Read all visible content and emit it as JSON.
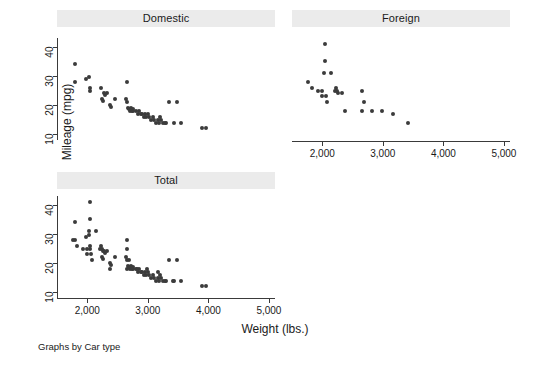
{
  "figure": {
    "y_axis_title": "Mileage (mpg)",
    "x_axis_title": "Weight (lbs.)",
    "note": "Graphs by Car type",
    "background": "#ffffff",
    "marker_color": "#3b3b3b",
    "strip_color": "#ebebeb",
    "axis_color": "#3a3a3a"
  },
  "chart_data": {
    "type": "scatter",
    "title": "",
    "xlabel": "Weight (lbs.)",
    "ylabel": "Mileage (mpg)",
    "note": "Graphs by Car type",
    "xlim": [
      1500,
      5100
    ],
    "ylim": [
      8,
      43
    ],
    "xticks": [
      2000,
      3000,
      4000,
      5000
    ],
    "xtick_labels": [
      "2,000",
      "3,000",
      "4,000",
      "5,000"
    ],
    "yticks": [
      10,
      20,
      30,
      40
    ],
    "ytick_labels": [
      "10",
      "20",
      "30",
      "40"
    ],
    "grid": false,
    "legend": "none",
    "faceted_by": "Car type",
    "panels": [
      {
        "label": "Domestic",
        "row": 0,
        "col": 0,
        "n": 52,
        "points": [
          [
            1800,
            34
          ],
          [
            1800,
            28
          ],
          [
            1980,
            29
          ],
          [
            2020,
            29.5
          ],
          [
            2040,
            26
          ],
          [
            2050,
            25
          ],
          [
            2230,
            26
          ],
          [
            2280,
            24
          ],
          [
            2300,
            23.5
          ],
          [
            2330,
            24
          ],
          [
            2240,
            22
          ],
          [
            2260,
            21.5
          ],
          [
            2370,
            20
          ],
          [
            2390,
            19.5
          ],
          [
            2450,
            22
          ],
          [
            2650,
            28
          ],
          [
            2640,
            22
          ],
          [
            2650,
            21
          ],
          [
            2670,
            19
          ],
          [
            2690,
            18.5
          ],
          [
            2700,
            18
          ],
          [
            2720,
            19
          ],
          [
            2730,
            18
          ],
          [
            2750,
            18
          ],
          [
            2760,
            18.5
          ],
          [
            2800,
            18
          ],
          [
            2830,
            17
          ],
          [
            2850,
            18
          ],
          [
            2880,
            17
          ],
          [
            2900,
            17
          ],
          [
            2930,
            16
          ],
          [
            2950,
            17
          ],
          [
            2970,
            16
          ],
          [
            3000,
            17
          ],
          [
            3020,
            16
          ],
          [
            3050,
            15
          ],
          [
            3080,
            16
          ],
          [
            3100,
            15
          ],
          [
            3130,
            14
          ],
          [
            3160,
            15
          ],
          [
            3180,
            14
          ],
          [
            3200,
            16
          ],
          [
            3210,
            15
          ],
          [
            3250,
            14
          ],
          [
            3280,
            14
          ],
          [
            3300,
            14
          ],
          [
            3350,
            21
          ],
          [
            3430,
            14
          ],
          [
            3480,
            21
          ],
          [
            3550,
            14
          ],
          [
            3900,
            12
          ],
          [
            3960,
            12
          ]
        ]
      },
      {
        "label": "Foreign",
        "row": 0,
        "col": 1,
        "n": 22,
        "points": [
          [
            2040,
            41
          ],
          [
            2040,
            35
          ],
          [
            2030,
            31
          ],
          [
            2150,
            31
          ],
          [
            1760,
            28
          ],
          [
            1830,
            26
          ],
          [
            1930,
            25
          ],
          [
            1990,
            25
          ],
          [
            2000,
            23
          ],
          [
            2060,
            23
          ],
          [
            2230,
            26
          ],
          [
            2210,
            25
          ],
          [
            2250,
            25
          ],
          [
            2260,
            24
          ],
          [
            2330,
            24
          ],
          [
            2070,
            21
          ],
          [
            2380,
            18
          ],
          [
            2650,
            25
          ],
          [
            2690,
            21
          ],
          [
            2660,
            18
          ],
          [
            2820,
            18
          ],
          [
            2990,
            18
          ],
          [
            3170,
            17
          ],
          [
            3420,
            14
          ]
        ]
      },
      {
        "label": "Total",
        "row": 1,
        "col": 0,
        "n": 74,
        "points": [
          [
            2040,
            41
          ],
          [
            2040,
            35
          ],
          [
            1800,
            34
          ],
          [
            2030,
            31
          ],
          [
            2150,
            31
          ],
          [
            1760,
            28
          ],
          [
            1800,
            28
          ],
          [
            1980,
            29
          ],
          [
            2020,
            29.5
          ],
          [
            1830,
            26
          ],
          [
            1930,
            25
          ],
          [
            1990,
            25
          ],
          [
            2040,
            26
          ],
          [
            2050,
            25
          ],
          [
            2000,
            23
          ],
          [
            2060,
            23
          ],
          [
            2070,
            21
          ],
          [
            2230,
            26
          ],
          [
            2210,
            25
          ],
          [
            2250,
            25
          ],
          [
            2260,
            24
          ],
          [
            2280,
            24
          ],
          [
            2300,
            23.5
          ],
          [
            2330,
            24
          ],
          [
            2240,
            22
          ],
          [
            2260,
            21.5
          ],
          [
            2370,
            20
          ],
          [
            2390,
            19.5
          ],
          [
            2380,
            18
          ],
          [
            2450,
            22
          ],
          [
            2650,
            28
          ],
          [
            2640,
            22
          ],
          [
            2650,
            25
          ],
          [
            2690,
            21
          ],
          [
            2660,
            18
          ],
          [
            2650,
            21
          ],
          [
            2670,
            19
          ],
          [
            2690,
            18.5
          ],
          [
            2700,
            18
          ],
          [
            2720,
            19
          ],
          [
            2730,
            18
          ],
          [
            2750,
            18
          ],
          [
            2760,
            18.5
          ],
          [
            2800,
            18
          ],
          [
            2820,
            18
          ],
          [
            2830,
            17
          ],
          [
            2850,
            18
          ],
          [
            2880,
            17
          ],
          [
            2900,
            17
          ],
          [
            2930,
            16
          ],
          [
            2950,
            17
          ],
          [
            2970,
            16
          ],
          [
            2990,
            18
          ],
          [
            3000,
            17
          ],
          [
            3020,
            16
          ],
          [
            3050,
            15
          ],
          [
            3080,
            16
          ],
          [
            3100,
            15
          ],
          [
            3130,
            14
          ],
          [
            3160,
            15
          ],
          [
            3170,
            17
          ],
          [
            3180,
            14
          ],
          [
            3200,
            16
          ],
          [
            3210,
            15
          ],
          [
            3250,
            14
          ],
          [
            3280,
            14
          ],
          [
            3300,
            14
          ],
          [
            3350,
            21
          ],
          [
            3420,
            14
          ],
          [
            3430,
            14
          ],
          [
            3480,
            21
          ],
          [
            3550,
            14
          ],
          [
            3900,
            12
          ],
          [
            3960,
            12
          ]
        ]
      }
    ]
  }
}
